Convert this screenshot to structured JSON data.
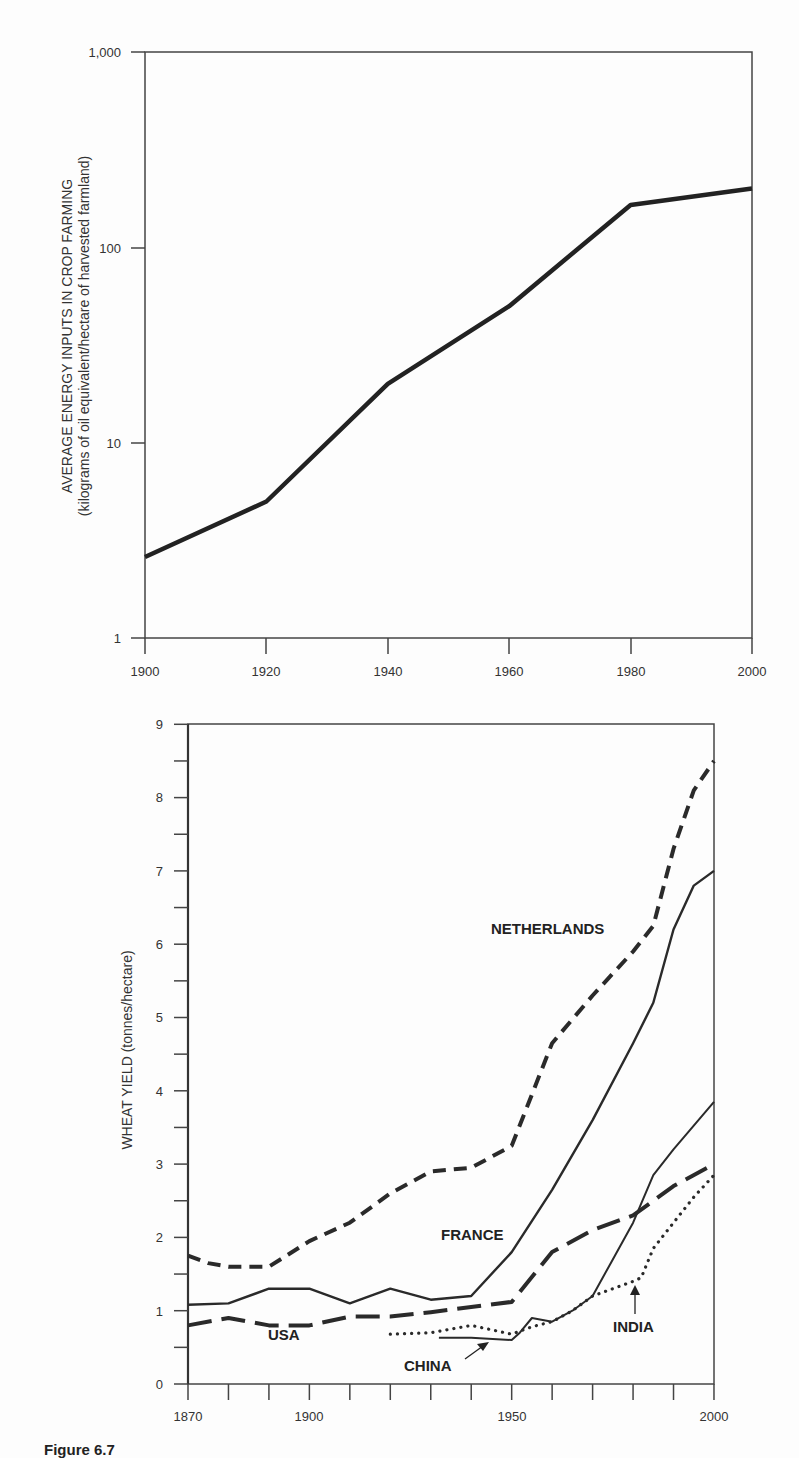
{
  "caption": "Figure 6.7",
  "chart_data": [
    {
      "type": "line",
      "title": "",
      "ylabel_line1": "AVERAGE ENERGY INPUTS IN CROP FARMING",
      "ylabel_line2": "(kilograms of oil equivalent/hectare of harvested farmland)",
      "xlabel": "",
      "yscale": "log",
      "ylim": [
        1,
        1000
      ],
      "xlim": [
        1900,
        2000
      ],
      "xticks": [
        "1900",
        "1920",
        "1940",
        "1960",
        "1980",
        "2000"
      ],
      "yticks": [
        "1",
        "10",
        "100",
        "1,000"
      ],
      "grid": false,
      "series": [
        {
          "name": "Energy inputs",
          "x": [
            1900,
            1920,
            1940,
            1960,
            1980,
            2000
          ],
          "values": [
            2.6,
            5,
            20,
            50,
            165,
            200
          ]
        }
      ]
    },
    {
      "type": "line",
      "title": "",
      "ylabel": "WHEAT YIELD (tonnes/hectare)",
      "xlabel": "",
      "ylim": [
        0,
        9
      ],
      "xlim": [
        1870,
        2000
      ],
      "xticks": [
        "1870",
        "1900",
        "1950",
        "2000"
      ],
      "yticks": [
        "0",
        "1",
        "2",
        "3",
        "4",
        "5",
        "6",
        "7",
        "8",
        "9"
      ],
      "grid": false,
      "legend": "inline labels",
      "series": [
        {
          "name": "NETHERLANDS",
          "style": "short-dash",
          "x": [
            1870,
            1875,
            1880,
            1885,
            1890,
            1900,
            1910,
            1920,
            1930,
            1940,
            1950,
            1960,
            1970,
            1980,
            1985,
            1990,
            1995,
            2000
          ],
          "values": [
            1.75,
            1.65,
            1.6,
            1.6,
            1.6,
            1.95,
            2.2,
            2.6,
            2.9,
            2.95,
            3.25,
            4.65,
            5.3,
            5.9,
            6.25,
            7.3,
            8.1,
            8.5
          ]
        },
        {
          "name": "FRANCE",
          "style": "solid",
          "x": [
            1870,
            1880,
            1890,
            1900,
            1910,
            1920,
            1930,
            1940,
            1950,
            1960,
            1970,
            1980,
            1985,
            1990,
            1995,
            2000
          ],
          "values": [
            1.08,
            1.1,
            1.3,
            1.3,
            1.1,
            1.3,
            1.15,
            1.2,
            1.8,
            2.65,
            3.6,
            4.65,
            5.2,
            6.2,
            6.8,
            7.0
          ]
        },
        {
          "name": "USA",
          "style": "long-dash",
          "x": [
            1870,
            1880,
            1890,
            1900,
            1910,
            1920,
            1930,
            1940,
            1950,
            1960,
            1970,
            1980,
            1990,
            2000
          ],
          "values": [
            0.8,
            0.9,
            0.8,
            0.8,
            0.92,
            0.92,
            0.98,
            1.05,
            1.12,
            1.8,
            2.1,
            2.3,
            2.7,
            3.0
          ]
        },
        {
          "name": "CHINA",
          "style": "solid-thin",
          "x": [
            1932,
            1940,
            1950,
            1952,
            1955,
            1960,
            1965,
            1970,
            1975,
            1980,
            1985,
            1990,
            2000
          ],
          "values": [
            0.63,
            0.63,
            0.6,
            0.7,
            0.9,
            0.85,
            1.0,
            1.2,
            1.7,
            2.2,
            2.85,
            3.2,
            3.85
          ]
        },
        {
          "name": "INDIA",
          "style": "dotted",
          "x": [
            1920,
            1930,
            1940,
            1950,
            1955,
            1960,
            1965,
            1970,
            1980,
            1982,
            1985,
            1990,
            1995,
            2000
          ],
          "values": [
            0.68,
            0.7,
            0.8,
            0.68,
            0.78,
            0.85,
            1.0,
            1.2,
            1.4,
            1.45,
            1.85,
            2.2,
            2.55,
            2.85
          ]
        }
      ],
      "annotations": [
        {
          "text": "NETHERLANDS"
        },
        {
          "text": "FRANCE"
        },
        {
          "text": "USA"
        },
        {
          "text": "CHINA",
          "arrow": true
        },
        {
          "text": "INDIA",
          "arrow": true
        }
      ]
    }
  ]
}
